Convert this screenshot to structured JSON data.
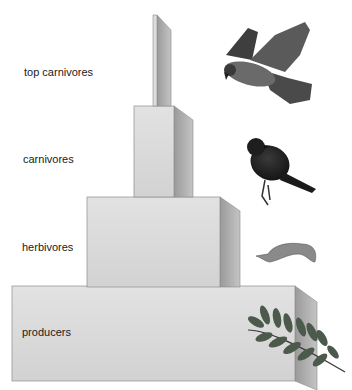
{
  "diagram": {
    "type": "energy-pyramid",
    "levels": [
      {
        "label": "top carnivores",
        "organism": "hawk"
      },
      {
        "label": "carnivores",
        "organism": "songbird"
      },
      {
        "label": "herbivores",
        "organism": "caterpillar"
      },
      {
        "label": "producers",
        "organism": "plant-leaves"
      }
    ]
  },
  "colors": {
    "front": "#dcdcdc",
    "side": "#a9a9a9",
    "top": "#ececec",
    "edge": "#8c8c8c",
    "text": "#1a1a1a"
  }
}
